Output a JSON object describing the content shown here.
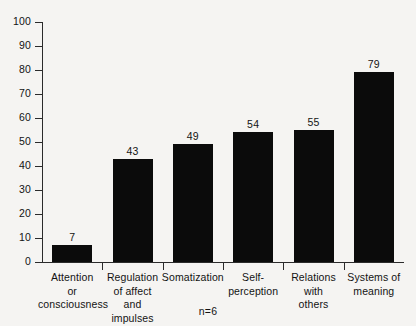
{
  "chart_data": {
    "type": "bar",
    "title": "",
    "subtitle": "",
    "xlabel": "",
    "ylabel": "",
    "ylim": [
      0,
      100
    ],
    "grid": false,
    "legend": "none",
    "orientation": "vertical",
    "bar_color": "#0b0b0b",
    "background_color": "#f5f4f2",
    "axis_color": "#2b2b2b",
    "categories": [
      "Attention or consciousness",
      "Regulation of affect and impulses",
      "Somatization",
      "Self-perception",
      "Relations with others",
      "Systems of meaning"
    ],
    "category_label_lines": [
      [
        "Attention",
        "or",
        "consciousness"
      ],
      [
        "Regulation",
        "of affect",
        "and",
        "impulses"
      ],
      [
        "Somatization"
      ],
      [
        "Self-",
        "perception"
      ],
      [
        "Relations",
        "with",
        "others"
      ],
      [
        "Systems of",
        "meaning"
      ]
    ],
    "values": [
      7,
      43,
      49,
      54,
      55,
      79
    ],
    "value_labels": [
      "7",
      "43",
      "49",
      "54",
      "55",
      "79"
    ],
    "ytick_values": [
      0,
      10,
      20,
      30,
      40,
      50,
      60,
      70,
      80,
      90,
      100
    ],
    "ytick_labels": [
      "0",
      "10",
      "20",
      "30",
      "40",
      "50",
      "60",
      "70",
      "80",
      "90",
      "100"
    ],
    "annotations": [
      "n=6"
    ]
  },
  "footnote": {
    "sample_size": "n=6"
  }
}
